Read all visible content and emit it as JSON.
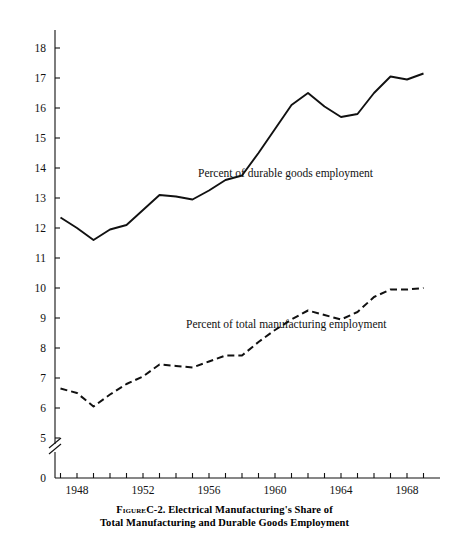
{
  "figure": {
    "axis_title": "Percent",
    "caption_prefix": "Figure",
    "caption_line1": "C-2. Electrical Manufacturing's Share of",
    "caption_line2": "Total Manufacturing and Durable Goods Employment"
  },
  "colors": {
    "ink": "#111111",
    "background": "#ffffff"
  },
  "chart_data": {
    "type": "line",
    "xlabel": "",
    "ylabel": "Percent",
    "xlim": [
      1946.5,
      1969.5
    ],
    "ylim": [
      3,
      18.6
    ],
    "y_axis_break": true,
    "y_break_below": 3,
    "grid": false,
    "legend_position": "inline-annotation",
    "yticks": [
      0,
      3,
      4,
      5,
      6,
      7,
      8,
      9,
      10,
      11,
      12,
      13,
      14,
      15,
      16,
      17,
      18
    ],
    "ytick_labels": [
      "0",
      "3",
      "4",
      "5",
      "6",
      "7",
      "8",
      "9",
      "10",
      "11",
      "12",
      "13",
      "14",
      "15",
      "16",
      "17",
      "18"
    ],
    "xticks": [
      1948,
      1952,
      1956,
      1960,
      1964,
      1968
    ],
    "xtick_labels": [
      "1948",
      "1952",
      "1956",
      "1960",
      "1964",
      "1968"
    ],
    "x_minor_ticks": [
      1947,
      1949,
      1950,
      1951,
      1953,
      1954,
      1955,
      1957,
      1958,
      1959,
      1961,
      1962,
      1963,
      1965,
      1966,
      1967,
      1969
    ],
    "x": [
      1947,
      1948,
      1949,
      1950,
      1951,
      1952,
      1953,
      1954,
      1955,
      1956,
      1957,
      1958,
      1959,
      1960,
      1961,
      1962,
      1963,
      1964,
      1965,
      1966,
      1967,
      1968,
      1969
    ],
    "series": [
      {
        "name": "Percent of durable goods employment",
        "style": "solid",
        "annotation": "Percent of durable goods employment",
        "values": [
          12.35,
          12.0,
          11.6,
          11.95,
          12.1,
          12.6,
          13.1,
          13.05,
          12.95,
          13.25,
          13.6,
          13.75,
          14.5,
          15.3,
          16.1,
          16.5,
          16.05,
          15.7,
          15.8,
          16.5,
          17.05,
          16.95,
          17.15
        ]
      },
      {
        "name": "Percent of total manufacturing employment",
        "style": "dashed",
        "annotation": "Percent of total manufacturing employment",
        "values": [
          6.65,
          6.5,
          6.05,
          6.45,
          6.8,
          7.05,
          7.45,
          7.4,
          7.35,
          7.55,
          7.75,
          7.75,
          8.2,
          8.6,
          8.95,
          9.25,
          9.1,
          8.95,
          9.2,
          9.7,
          9.95,
          9.95,
          10.0
        ]
      }
    ]
  }
}
